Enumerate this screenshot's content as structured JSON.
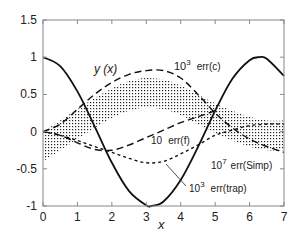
{
  "chart_data": {
    "type": "line",
    "title": "",
    "xlabel": "x",
    "ylabel": "",
    "xlim": [
      0,
      7
    ],
    "ylim": [
      -1,
      1.5
    ],
    "grid": false,
    "x_ticks": [
      0,
      1,
      2,
      3,
      4,
      5,
      6,
      7
    ],
    "y_ticks": [
      -1,
      -0.5,
      0,
      0.5,
      1,
      1.5
    ],
    "x_tick_labels": [
      "0",
      "1",
      "2",
      "3",
      "4",
      "5",
      "6",
      "7"
    ],
    "y_tick_labels": [
      "-1",
      "-0.5",
      "0",
      "0.5",
      "1",
      "1.5"
    ],
    "series": [
      {
        "name": "y(x)",
        "style": "solid",
        "x": [
          0,
          0.5,
          1,
          1.5,
          2,
          2.5,
          3,
          3.14,
          3.5,
          4,
          4.5,
          5,
          5.5,
          6,
          6.28,
          6.5,
          7
        ],
        "values": [
          1,
          0.88,
          0.54,
          0.07,
          -0.42,
          -0.8,
          -0.99,
          -1,
          -0.94,
          -0.65,
          -0.21,
          0.28,
          0.71,
          0.96,
          1,
          0.98,
          0.75
        ]
      },
      {
        "name": "10^3 err(c)",
        "style": "long-dash",
        "x": [
          0,
          0.5,
          1,
          1.5,
          2,
          2.5,
          3,
          3.5,
          4,
          4.5,
          5,
          5.5,
          6,
          6.5,
          7
        ],
        "values": [
          0,
          0.1,
          0.3,
          0.5,
          0.66,
          0.77,
          0.82,
          0.82,
          0.72,
          0.5,
          0.25,
          0.05,
          -0.1,
          -0.2,
          -0.28
        ]
      },
      {
        "name": "10 err(f)",
        "style": "long-dash",
        "x": [
          0,
          0.5,
          1,
          1.5,
          2,
          2.5,
          3,
          3.5,
          4,
          4.5,
          5
        ],
        "values": [
          0,
          -0.05,
          -0.15,
          -0.24,
          -0.25,
          -0.18,
          -0.08,
          0.02,
          0.12,
          0.2,
          0.28
        ]
      },
      {
        "name": "10^3 err(trap)",
        "style": "short-dash",
        "x": [
          0,
          0.5,
          1,
          1.5,
          2,
          2.5,
          3,
          3.5,
          4,
          4.5,
          5,
          5.5,
          6,
          6.5,
          7
        ],
        "values": [
          0,
          -0.05,
          -0.12,
          -0.2,
          -0.28,
          -0.36,
          -0.42,
          -0.4,
          -0.3,
          -0.18,
          -0.05,
          0.02,
          0.08,
          0.1,
          0.1
        ]
      },
      {
        "name": "10^7 err(Simp)",
        "style": "dotted-band",
        "x": [
          0,
          0.5,
          1,
          1.5,
          2,
          2.5,
          3,
          3.5,
          4,
          4.5,
          5,
          5.5,
          6,
          6.5,
          7
        ],
        "center": [
          -0.2,
          -0.05,
          0.1,
          0.25,
          0.38,
          0.48,
          0.52,
          0.5,
          0.42,
          0.3,
          0.18,
          0.08,
          0.0,
          -0.05,
          -0.05
        ],
        "half_width": 0.2
      }
    ],
    "annotations": [
      {
        "text": "y (x)",
        "x": 1.7,
        "y": 0.95
      },
      {
        "text": "10^3  err(c)",
        "x": 4.5,
        "y": 0.8
      },
      {
        "text": "10  err(f)",
        "x": 3.2,
        "y": -0.15
      },
      {
        "text": "10^7  err(Simp)",
        "x": 5.2,
        "y": -0.42
      },
      {
        "text": "10^3  err(trap)",
        "x": 4.2,
        "y": -0.68
      }
    ]
  },
  "labels": {
    "yx": "y (x)",
    "errc_base": "10",
    "errc_exp": "3",
    "errc_text": "err(c)",
    "errf_base": "10",
    "errf_text": "err(f)",
    "simp_base": "10",
    "simp_exp": "7",
    "simp_text": "err(Simp)",
    "trap_base": "10",
    "trap_exp": "3",
    "trap_text": "err(trap)",
    "xlabel": "x"
  }
}
